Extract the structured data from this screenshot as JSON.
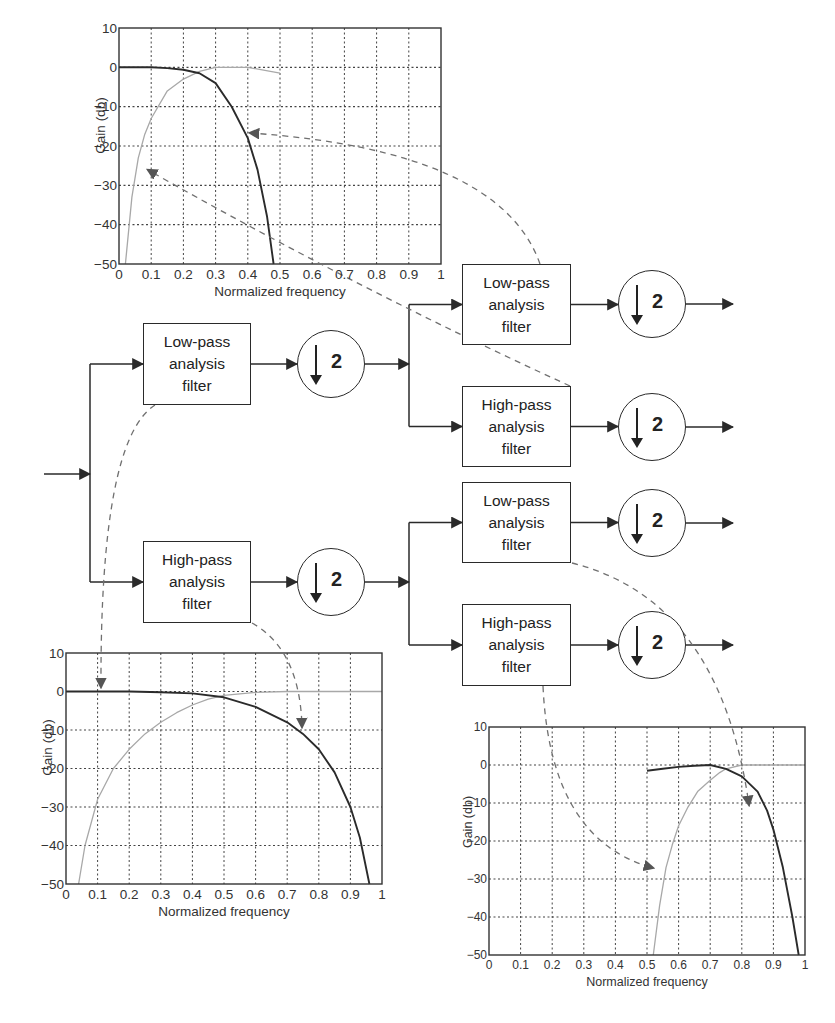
{
  "diagram": {
    "down_factor": "2",
    "filters": {
      "lowpass": [
        "Low-pass",
        "analysis",
        "filter"
      ],
      "highpass": [
        "High-pass",
        "analysis",
        "filter"
      ]
    },
    "level1": [
      {
        "id": "L",
        "type": "lowpass",
        "box": [
          143,
          323,
          108,
          82
        ],
        "circle": [
          331,
          364
        ]
      },
      {
        "id": "H",
        "type": "highpass",
        "box": [
          143,
          541,
          108,
          82
        ],
        "circle": [
          331,
          582
        ]
      }
    ],
    "level2": [
      {
        "id": "LL",
        "type": "lowpass",
        "box": [
          462,
          264,
          109,
          81
        ],
        "circle": [
          652,
          304
        ]
      },
      {
        "id": "LH",
        "type": "highpass",
        "box": [
          462,
          386,
          109,
          81
        ],
        "circle": [
          652,
          427
        ]
      },
      {
        "id": "HL",
        "type": "lowpass",
        "box": [
          462,
          482,
          109,
          81
        ],
        "circle": [
          652,
          523
        ]
      },
      {
        "id": "HH",
        "type": "highpass",
        "box": [
          462,
          604,
          109,
          82
        ],
        "circle": [
          652,
          645
        ]
      }
    ],
    "input_arrow": {
      "from": [
        44,
        474
      ],
      "to": [
        90,
        474
      ]
    },
    "colors": {
      "line": "#2a2a2a",
      "dashed": "#707070",
      "grid": "#444444",
      "highpass_curve": "#a8a8a8",
      "lowpass_curve": "#2b2b2b"
    }
  },
  "plots": {
    "x_label": "Normalized frequency",
    "y_label": "Gain (db)",
    "x_ticks": [
      "0",
      "0.1",
      "0.2",
      "0.3",
      "0.4",
      "0.5",
      "0.6",
      "0.7",
      "0.8",
      "0.9",
      "1"
    ],
    "y_ticks": [
      "10",
      "0",
      "−10",
      "−20",
      "−30",
      "−40",
      "−50"
    ]
  },
  "chart_data": [
    {
      "type": "line",
      "name": "level-2 low band (from low-pass branch)",
      "frame": [
        119,
        28,
        441,
        264
      ],
      "title": "",
      "xlabel": "Normalized frequency",
      "ylabel": "Gain (db)",
      "xlim": [
        0,
        1
      ],
      "ylim": [
        -50,
        10
      ],
      "grid": true,
      "x_ticks": [
        0,
        0.1,
        0.2,
        0.3,
        0.4,
        0.5,
        0.6,
        0.7,
        0.8,
        0.9,
        1
      ],
      "y_ticks": [
        10,
        0,
        -10,
        -20,
        -30,
        -40,
        -50
      ],
      "series": [
        {
          "name": "Low-pass (LL)",
          "color": "#2b2b2b",
          "x": [
            0,
            0.1,
            0.15,
            0.2,
            0.25,
            0.3,
            0.35,
            0.4,
            0.43,
            0.46,
            0.48
          ],
          "y": [
            0,
            0,
            -0.2,
            -0.6,
            -1.5,
            -4,
            -10,
            -18,
            -26,
            -38,
            -50
          ]
        },
        {
          "name": "High-pass (LH)",
          "color": "#a8a8a8",
          "x": [
            0.02,
            0.04,
            0.06,
            0.08,
            0.1,
            0.15,
            0.2,
            0.25,
            0.3,
            0.4,
            0.5
          ],
          "y": [
            -50,
            -33,
            -23,
            -17,
            -13,
            -6,
            -3,
            -1,
            0,
            0,
            -1.5
          ]
        }
      ]
    },
    {
      "type": "line",
      "name": "level-1 responses",
      "frame": [
        66,
        653,
        382,
        884
      ],
      "title": "",
      "xlabel": "Normalized frequency",
      "ylabel": "Gain (db)",
      "xlim": [
        0,
        1
      ],
      "ylim": [
        -50,
        10
      ],
      "grid": true,
      "x_ticks": [
        0,
        0.1,
        0.2,
        0.3,
        0.4,
        0.5,
        0.6,
        0.7,
        0.8,
        0.9,
        1
      ],
      "y_ticks": [
        10,
        0,
        -10,
        -20,
        -30,
        -40,
        -50
      ],
      "series": [
        {
          "name": "Low-pass (L)",
          "color": "#2b2b2b",
          "x": [
            0,
            0.2,
            0.3,
            0.4,
            0.5,
            0.6,
            0.7,
            0.75,
            0.8,
            0.85,
            0.9,
            0.93,
            0.96
          ],
          "y": [
            0,
            0,
            -0.2,
            -0.5,
            -1.5,
            -4,
            -8,
            -11,
            -15,
            -21,
            -30,
            -38,
            -50
          ]
        },
        {
          "name": "High-pass (H)",
          "color": "#a8a8a8",
          "x": [
            0.04,
            0.06,
            0.1,
            0.15,
            0.2,
            0.25,
            0.3,
            0.35,
            0.4,
            0.45,
            0.5,
            0.6,
            0.7,
            1
          ],
          "y": [
            -50,
            -40,
            -28,
            -20,
            -15,
            -11,
            -8,
            -5.5,
            -3.5,
            -2,
            -1,
            -0.2,
            0,
            0
          ]
        }
      ]
    },
    {
      "type": "line",
      "name": "level-2 high band (from high-pass branch)",
      "frame": [
        489,
        727,
        805,
        955
      ],
      "title": "",
      "xlabel": "Normalized frequency",
      "ylabel": "Gain (db)",
      "xlim": [
        0,
        1
      ],
      "ylim": [
        -50,
        10
      ],
      "grid": true,
      "x_ticks": [
        0,
        0.1,
        0.2,
        0.3,
        0.4,
        0.5,
        0.6,
        0.7,
        0.8,
        0.9,
        1
      ],
      "y_ticks": [
        10,
        0,
        -10,
        -20,
        -30,
        -40,
        -50
      ],
      "series": [
        {
          "name": "Low-pass (HL)",
          "color": "#2b2b2b",
          "x": [
            0.5,
            0.55,
            0.6,
            0.65,
            0.7,
            0.75,
            0.8,
            0.85,
            0.88,
            0.9,
            0.93,
            0.96,
            0.98
          ],
          "y": [
            -1.5,
            -1,
            -0.5,
            -0.2,
            0,
            -1,
            -3,
            -7,
            -12,
            -17,
            -27,
            -40,
            -50
          ]
        },
        {
          "name": "High-pass (HH)",
          "color": "#a8a8a8",
          "x": [
            0.52,
            0.54,
            0.56,
            0.58,
            0.6,
            0.63,
            0.66,
            0.7,
            0.73,
            0.75,
            0.8,
            1
          ],
          "y": [
            -50,
            -37,
            -27,
            -21,
            -16,
            -11,
            -7,
            -4,
            -2,
            -1,
            0,
            0
          ]
        }
      ]
    }
  ],
  "connectors": [
    {
      "from": "LL",
      "to_plot": 0,
      "path": "M 540 264 Q 500 150 250 133",
      "arrow_at": [
        251,
        133
      ],
      "arrow_dir": "left"
    },
    {
      "from": "LH",
      "to_plot": 0,
      "path": "M 570 386 Q 360 290 148 170",
      "arrow_at": [
        146,
        169
      ],
      "arrow_dir": "left"
    },
    {
      "from": "L",
      "to_plot": 1,
      "path": "M 155 405 Q 100 440 101 687",
      "arrow_at": [
        102,
        689
      ],
      "arrow_dir": "down"
    },
    {
      "from": "H",
      "to_plot": 1,
      "path": "M 252 623 Q 300 650 302 727",
      "arrow_at": [
        302,
        729
      ],
      "arrow_dir": "down"
    },
    {
      "from": "HL",
      "to_plot": 2,
      "path": "M 572 563 Q 720 600 749 805",
      "arrow_at": [
        750,
        808
      ],
      "arrow_dir": "down"
    },
    {
      "from": "HH",
      "to_plot": 2,
      "path": "M 543 686 Q 550 840 653 868",
      "arrow_at": [
        664,
        869
      ],
      "arrow_dir": "right"
    }
  ],
  "caption": ""
}
